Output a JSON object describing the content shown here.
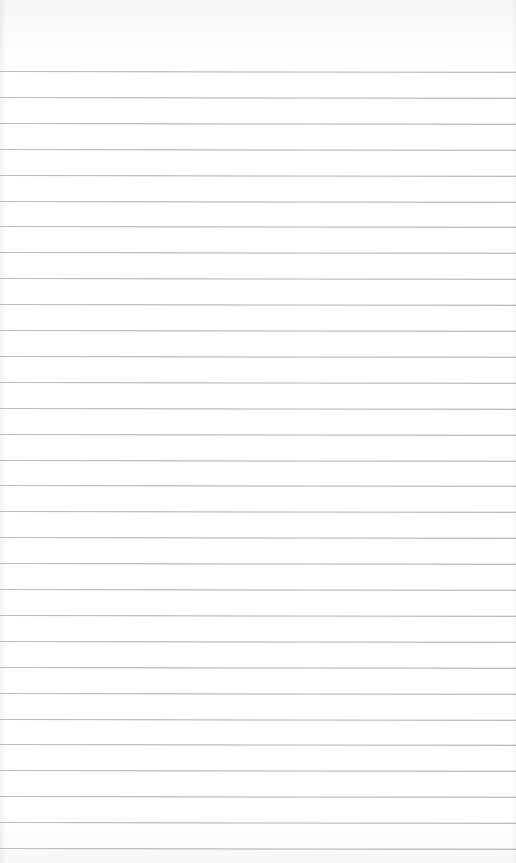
{
  "page": {
    "type": "lined-paper",
    "background_color": "#ffffff",
    "rule_color": "#aaaaaa",
    "first_rule_y": 71,
    "rule_spacing": 25.9,
    "rule_count": 31,
    "text": ""
  }
}
